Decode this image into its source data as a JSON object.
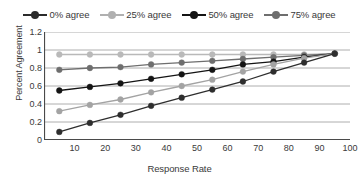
{
  "chart_data": {
    "type": "line",
    "title": "",
    "xlabel": "Response Rate",
    "ylabel": "Percent Agreement",
    "xlim": [
      0,
      100
    ],
    "ylim": [
      0,
      1.2
    ],
    "grid": true,
    "legend_position": "top",
    "x": [
      5,
      15,
      25,
      35,
      45,
      55,
      65,
      75,
      85,
      95
    ],
    "xticks": [
      10,
      20,
      30,
      40,
      50,
      60,
      70,
      80,
      90,
      100
    ],
    "xtick_labels": [
      "10",
      "20",
      "30",
      "40",
      "50",
      "60",
      "70",
      "80",
      "90",
      "100"
    ],
    "yticks": [
      0,
      0.2,
      0.4,
      0.6,
      0.8,
      1,
      1.2
    ],
    "ytick_labels": [
      "0",
      "0.2",
      "0.4",
      "0.6",
      "0.8",
      "1",
      "1.2"
    ],
    "series": [
      {
        "name": "100% agree",
        "color": "#b9b9b9",
        "values": [
          0.95,
          0.95,
          0.95,
          0.95,
          0.95,
          0.95,
          0.95,
          0.95,
          0.95,
          0.96
        ]
      },
      {
        "name": "75% agree",
        "color": "#6e6e6e",
        "values": [
          0.78,
          0.8,
          0.81,
          0.84,
          0.86,
          0.88,
          0.9,
          0.92,
          0.94,
          0.96
        ]
      },
      {
        "name": "50% agree",
        "color": "#141414",
        "values": [
          0.55,
          0.59,
          0.63,
          0.68,
          0.73,
          0.78,
          0.84,
          0.87,
          0.92,
          0.96
        ]
      },
      {
        "name": "25% agree",
        "color": "#a3a3a3",
        "values": [
          0.32,
          0.39,
          0.45,
          0.53,
          0.6,
          0.67,
          0.76,
          0.84,
          0.91,
          0.96
        ]
      },
      {
        "name": "0% agree",
        "color": "#2e2e2e",
        "values": [
          0.09,
          0.19,
          0.28,
          0.38,
          0.47,
          0.56,
          0.65,
          0.76,
          0.86,
          0.96
        ]
      }
    ]
  },
  "legend": {
    "items": [
      {
        "label": "0% agree",
        "color": "#2b2b2b"
      },
      {
        "label": "25% agree",
        "color": "#b0b0b0"
      },
      {
        "label": "50% agree",
        "color": "#141414"
      },
      {
        "label": "75% agree",
        "color": "#6e6e6e"
      }
    ]
  },
  "axes": {
    "x_title": "Response Rate",
    "y_title": "Percent Agreement"
  }
}
